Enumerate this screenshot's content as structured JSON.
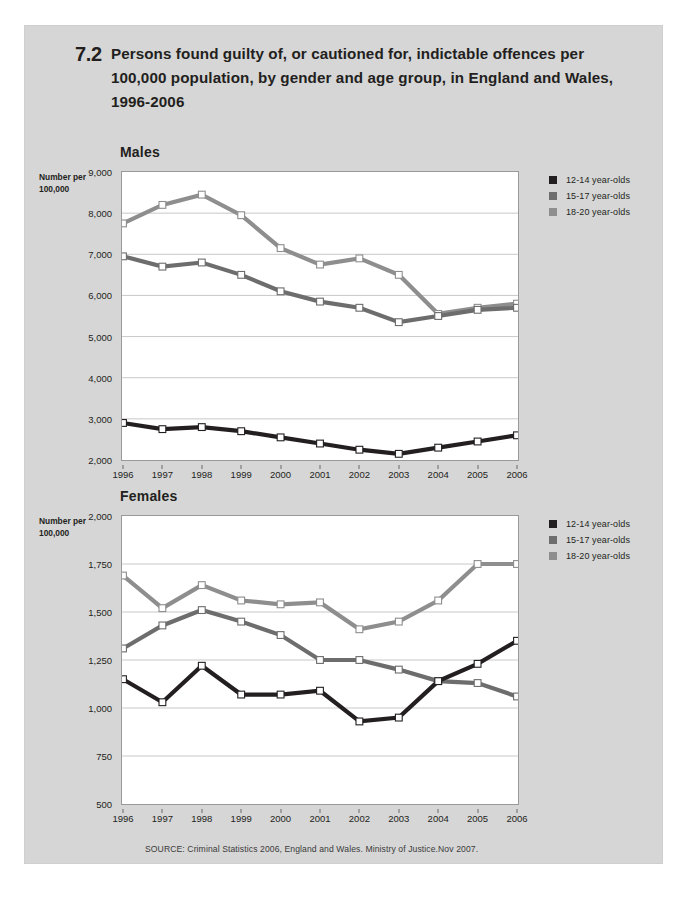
{
  "figure": {
    "number": "7.2",
    "title": "Persons found guilty of, or cautioned for, indictable offences per 100,000 population, by gender and age group, in England and Wales, 1996-2006",
    "source": "SOURCE: Criminal Statistics 2006, England and Wales. Ministry of Justice.Nov 2007."
  },
  "axis_caption": "Number per 100,000",
  "colors": {
    "series_12_14": "#231f20",
    "series_15_17": "#6d6d6d",
    "series_18_20": "#8e8e8e",
    "page_background": "#d6d6d6",
    "plot_background": "#ffffff",
    "gridline": "#c8c8c8",
    "frame": "#9a9a9a"
  },
  "legend": {
    "items": [
      {
        "label": "12-14 year-olds",
        "color": "#231f20"
      },
      {
        "label": "15-17 year-olds",
        "color": "#6d6d6d"
      },
      {
        "label": "18-20 year-olds",
        "color": "#8e8e8e"
      }
    ]
  },
  "chart_data": [
    {
      "id": "males",
      "type": "line",
      "title": "Males",
      "xlabel": "",
      "ylabel": "Number per 100,000",
      "grid": true,
      "legend_position": "right",
      "categories": [
        "1996",
        "1997",
        "1998",
        "1999",
        "2000",
        "2001",
        "2002",
        "2003",
        "2004",
        "2005",
        "2006"
      ],
      "ylim": [
        2000,
        9000
      ],
      "yticks": [
        2000,
        3000,
        4000,
        5000,
        6000,
        7000,
        8000,
        9000
      ],
      "ytick_labels": [
        "2,000",
        "3,000",
        "4,000",
        "5,000",
        "6,000",
        "7,000",
        "8,000",
        "9,000"
      ],
      "series": [
        {
          "name": "12-14 year-olds",
          "color": "#231f20",
          "values": [
            2900,
            2750,
            2800,
            2700,
            2550,
            2400,
            2250,
            2150,
            2300,
            2450,
            2600
          ]
        },
        {
          "name": "15-17 year-olds",
          "color": "#6d6d6d",
          "values": [
            6950,
            6700,
            6800,
            6500,
            6100,
            5850,
            5700,
            5350,
            5500,
            5650,
            5700
          ]
        },
        {
          "name": "18-20 year-olds",
          "color": "#8e8e8e",
          "values": [
            7750,
            8200,
            8450,
            7950,
            7150,
            6750,
            6900,
            6500,
            5550,
            5700,
            5800
          ]
        }
      ]
    },
    {
      "id": "females",
      "type": "line",
      "title": "Females",
      "xlabel": "",
      "ylabel": "Number per 100,000",
      "grid": true,
      "legend_position": "right",
      "categories": [
        "1996",
        "1997",
        "1998",
        "1999",
        "2000",
        "2001",
        "2002",
        "2003",
        "2004",
        "2005",
        "2006"
      ],
      "ylim": [
        500,
        2000
      ],
      "yticks": [
        500,
        750,
        1000,
        1250,
        1500,
        1750,
        2000
      ],
      "ytick_labels": [
        "500",
        "750",
        "1,000",
        "1,250",
        "1,500",
        "1,750",
        "2,000"
      ],
      "series": [
        {
          "name": "12-14 year-olds",
          "color": "#231f20",
          "values": [
            1150,
            1030,
            1220,
            1070,
            1070,
            1090,
            930,
            950,
            1140,
            1230,
            1350
          ]
        },
        {
          "name": "15-17 year-olds",
          "color": "#6d6d6d",
          "values": [
            1310,
            1430,
            1510,
            1450,
            1380,
            1250,
            1250,
            1200,
            1140,
            1130,
            1060
          ]
        },
        {
          "name": "18-20 year-olds",
          "color": "#8e8e8e",
          "values": [
            1690,
            1520,
            1640,
            1560,
            1540,
            1550,
            1410,
            1450,
            1560,
            1750,
            1750
          ]
        }
      ]
    }
  ]
}
